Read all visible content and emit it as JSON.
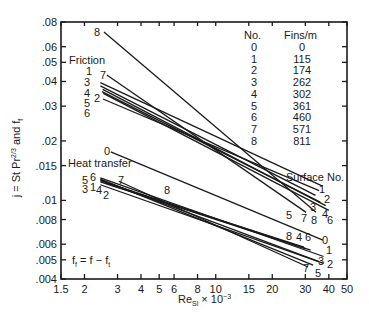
{
  "chart_data": {
    "type": "line",
    "title": "",
    "xlabel": "Re_Sl × 10^-3",
    "ylabel": "j = St Pr^2/3 and f_f",
    "xscale": "log",
    "yscale": "log",
    "xlim": [
      1.5,
      50
    ],
    "ylim": [
      0.004,
      0.08
    ],
    "grid": false,
    "x_ticks": [
      1.5,
      2,
      3,
      4,
      5,
      6,
      8,
      10,
      15,
      20,
      30,
      40,
      50
    ],
    "x_tick_labels": [
      "1.5",
      "2",
      "3",
      "4",
      "5",
      "6",
      "8",
      "10",
      "15",
      "20",
      "30",
      "40",
      "50"
    ],
    "y_ticks": [
      0.004,
      0.005,
      0.006,
      0.008,
      0.01,
      0.015,
      0.02,
      0.03,
      0.04,
      0.05,
      0.06,
      0.08
    ],
    "y_tick_labels": [
      ".004",
      ".005",
      ".006",
      ".008",
      ".01",
      ".015",
      ".02",
      ".03",
      ".04",
      ".05",
      ".06",
      ".08"
    ],
    "annotations": [
      "Friction",
      "Heat transfer",
      "Surface No.",
      "f_f = f − f_t"
    ],
    "legend_table": {
      "headers": [
        "No.",
        "Fins/m"
      ],
      "rows": [
        [
          "0",
          "0"
        ],
        [
          "1",
          "115"
        ],
        [
          "2",
          "174"
        ],
        [
          "3",
          "262"
        ],
        [
          "4",
          "302"
        ],
        [
          "5",
          "361"
        ],
        [
          "6",
          "460"
        ],
        [
          "7",
          "571"
        ],
        [
          "8",
          "811"
        ]
      ]
    },
    "series": [
      {
        "name": "Friction 8",
        "group": "friction",
        "x": [
          2.54,
          34.2
        ],
        "y": [
          0.0711,
          0.0087
        ]
      },
      {
        "name": "Friction 7",
        "group": "friction",
        "x": [
          2.63,
          30.3
        ],
        "y": [
          0.0431,
          0.0087
        ]
      },
      {
        "name": "Friction 1",
        "group": "friction",
        "x": [
          2.43,
          37.0
        ],
        "y": [
          0.0395,
          0.0118
        ]
      },
      {
        "name": "Friction 3",
        "group": "friction",
        "x": [
          2.43,
          34.0
        ],
        "y": [
          0.038,
          0.0106
        ]
      },
      {
        "name": "Friction 4",
        "group": "friction",
        "x": [
          2.5,
          38.5
        ],
        "y": [
          0.0365,
          0.0094
        ]
      },
      {
        "name": "Friction 5",
        "group": "friction",
        "x": [
          2.48,
          36.0
        ],
        "y": [
          0.0355,
          0.0098
        ]
      },
      {
        "name": "Friction 6",
        "group": "friction",
        "x": [
          2.52,
          40.0
        ],
        "y": [
          0.0348,
          0.0089
        ]
      },
      {
        "name": "Friction 2",
        "group": "friction",
        "x": [
          2.51,
          35.5
        ],
        "y": [
          0.0326,
          0.0112
        ]
      },
      {
        "name": "Heat transfer 0",
        "group": "heat",
        "x": [
          2.76,
          37.2
        ],
        "y": [
          0.0176,
          0.0063
        ]
      },
      {
        "name": "Heat transfer 1",
        "group": "heat",
        "x": [
          2.43,
          37.5
        ],
        "y": [
          0.013,
          0.0052
        ]
      },
      {
        "name": "Heat transfer 2",
        "group": "heat",
        "x": [
          2.43,
          37.5
        ],
        "y": [
          0.012,
          0.0048
        ]
      },
      {
        "name": "Heat transfer 3",
        "group": "heat",
        "x": [
          2.43,
          35.5
        ],
        "y": [
          0.0127,
          0.0049
        ]
      },
      {
        "name": "Heat transfer 4",
        "group": "heat",
        "x": [
          2.43,
          30.0
        ],
        "y": [
          0.0124,
          0.0057
        ]
      },
      {
        "name": "Heat transfer 5",
        "group": "heat",
        "x": [
          2.43,
          33.0
        ],
        "y": [
          0.0128,
          0.0047
        ]
      },
      {
        "name": "Heat transfer 6",
        "group": "heat",
        "x": [
          2.43,
          32.0
        ],
        "y": [
          0.0126,
          0.0056
        ]
      },
      {
        "name": "Heat transfer 7",
        "group": "heat",
        "x": [
          3.05,
          31.0
        ],
        "y": [
          0.0125,
          0.0046
        ]
      },
      {
        "name": "Heat transfer 8",
        "group": "heat",
        "x": [
          2.6,
          29.5
        ],
        "y": [
          0.0122,
          0.0058
        ]
      }
    ]
  },
  "labels": {
    "y_axis": "j = St Pr",
    "y_axis_sup": "2/3",
    "y_axis_tail": " and f",
    "y_axis_sub": "f",
    "x_axis_main": "Re",
    "x_axis_sub": "Sl",
    "x_axis_tail": " × 10",
    "x_axis_sup": "−3",
    "friction": "Friction",
    "heat_transfer": "Heat transfer",
    "surface_no": "Surface No.",
    "formula_f": "f",
    "formula_sub": "f",
    "formula_mid": " = f − f",
    "formula_sub2": "t",
    "table_h1": "No.",
    "table_h2": "Fins/m"
  }
}
